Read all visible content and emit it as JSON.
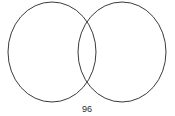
{
  "figure": {
    "name": "two-set-venn-diagram",
    "background_color": "#ffffff",
    "stroke_color": "#3a3a3a",
    "stroke_width": 1,
    "width": 175,
    "height": 116
  },
  "sets": {
    "left": {
      "label": "",
      "cx": 52,
      "cy": 52,
      "rx": 44,
      "ry": 50,
      "fill": "none"
    },
    "right": {
      "label": "",
      "cx": 122,
      "cy": 52,
      "rx": 44,
      "ry": 50,
      "fill": "none"
    }
  },
  "regions": {
    "left_only": "",
    "intersection": "",
    "right_only": ""
  },
  "caption": {
    "text": "96",
    "x": 87,
    "y": 112,
    "font_size": 9,
    "color": "#2b2b2b"
  }
}
